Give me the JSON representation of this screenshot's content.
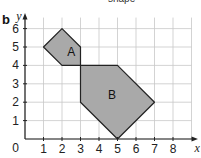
{
  "part_label": "b",
  "top_text_fragment": "shape",
  "axes": {
    "x_label": "x",
    "y_label": "y",
    "origin_label": "0",
    "x_ticks": [
      "1",
      "2",
      "3",
      "4",
      "5",
      "6",
      "7",
      "8"
    ],
    "y_ticks": [
      "1",
      "2",
      "3",
      "4",
      "5",
      "6"
    ]
  },
  "shapes": [
    {
      "label": "A",
      "vertices": [
        [
          1,
          5
        ],
        [
          2,
          6
        ],
        [
          3,
          5
        ],
        [
          3,
          4
        ],
        [
          2,
          4
        ]
      ],
      "fill": "#a9a9a9"
    },
    {
      "label": "B",
      "vertices": [
        [
          3,
          4
        ],
        [
          5,
          4
        ],
        [
          7,
          2
        ],
        [
          5,
          0
        ],
        [
          3,
          2
        ]
      ],
      "fill": "#a9a9a9"
    }
  ],
  "colors": {
    "grid": "#c8c8c8",
    "axis": "#222222",
    "shape_fill": "#a9a9a9",
    "shape_stroke": "#222222"
  }
}
